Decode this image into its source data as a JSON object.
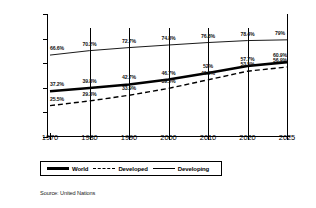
{
  "chart_data": {
    "type": "line",
    "title": "",
    "xlabel": "",
    "ylabel": "",
    "x": [
      1970,
      1980,
      1990,
      2000,
      2010,
      2020,
      2025
    ],
    "xtick_labels": [
      "1970",
      "1980",
      "1990",
      "2000",
      "2010",
      "2020",
      "2025"
    ],
    "ytick_labels": [
      "0%",
      "20%",
      "40%",
      "60%",
      "80%",
      "100%"
    ],
    "ytick_values": [
      0,
      20,
      40,
      60,
      80,
      100
    ],
    "ylim": [
      0,
      100
    ],
    "grid": false,
    "legend_position": "bottom",
    "series": [
      {
        "name": "World",
        "style": "thick-solid",
        "color": "#000000",
        "values": [
          37.2,
          39.8,
          42.7,
          46.7,
          52,
          57.7,
          60.9
        ],
        "labels": [
          "37.2%",
          "39.8%",
          "42.7%",
          "46.7%",
          "52%",
          "57.7%",
          "60.9%"
        ]
      },
      {
        "name": "Developed",
        "style": "dashed",
        "color": "#000000",
        "values": [
          25.5,
          29.3,
          33.9,
          39.5,
          46.5,
          53.5,
          56.9
        ],
        "labels": [
          "25.5%",
          "29.3%",
          "33.9%",
          "39.5%",
          "46.5%",
          "53.5%",
          "56.9%"
        ]
      },
      {
        "name": "Developing",
        "style": "thin-solid",
        "color": "#000000",
        "values": [
          66.6,
          70.2,
          72.7,
          74.8,
          76.8,
          78.4,
          79
        ],
        "labels": [
          "66.6%",
          "70.2%",
          "72.7%",
          "74.8%",
          "76.8%",
          "78.4%",
          "79%"
        ]
      }
    ],
    "source_note": "Source: United Nations"
  },
  "legend": {
    "world_label": "World",
    "developed_label": "Developed",
    "developing_label": "Developing"
  },
  "footer": {
    "source": "Source: United Nations"
  }
}
